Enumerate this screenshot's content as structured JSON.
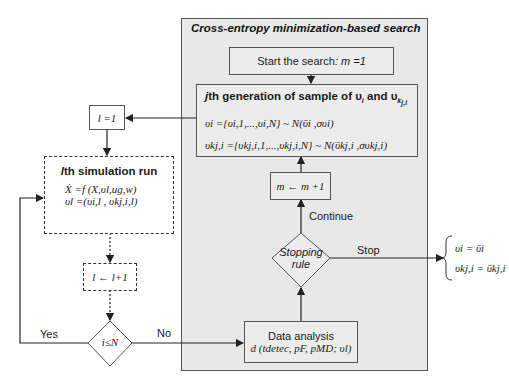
{
  "panel": {
    "title": "Cross-entropy minimization-based search"
  },
  "nodes": {
    "start": {
      "label": "Start the search",
      "expr": ": m =1"
    },
    "generation": {
      "title_var": "j",
      "title_text": "th generation of sample of υ",
      "title_sub_i": "i",
      "title_and": " and υ",
      "title_sub_k": "k",
      "title_sub_ji": "j,i",
      "line1": "υi ={υi,1,...,υi,N} ~ N(ῡi ,συi)",
      "line2": "υkj,i ={υkj,i,1,...,υkj,i,N} ~ N(ῡkj,i ,συkj,i)"
    },
    "m_increment": {
      "label": "m ← m +1"
    },
    "stopping_rule": {
      "line1": "Stopping",
      "line2": "rule"
    },
    "data_analysis": {
      "title": "Data analysis",
      "expr": "d (tdetec, pF, pMD; υl)"
    },
    "l_init": {
      "label": "l =1"
    },
    "simulation": {
      "title_var": "l",
      "title_text": "th simulation run",
      "line1": "Ẋ =f (X,υl,ug,w)",
      "line2": "υl =(υi,l , υkj,i,l)"
    },
    "l_increment": {
      "label": "l ← l+1"
    },
    "loop_check": {
      "label": "i≤N"
    }
  },
  "edges": {
    "continue_label": "Continue",
    "stop_label": "Stop",
    "yes_label": "Yes",
    "no_label": "No"
  },
  "output": {
    "line1": "υi = ῡi",
    "line2": "υkj,i = ῡkj,i"
  },
  "colors": {
    "panel_bg": "#e8e8e8",
    "border": "#555555",
    "line": "#222222"
  }
}
